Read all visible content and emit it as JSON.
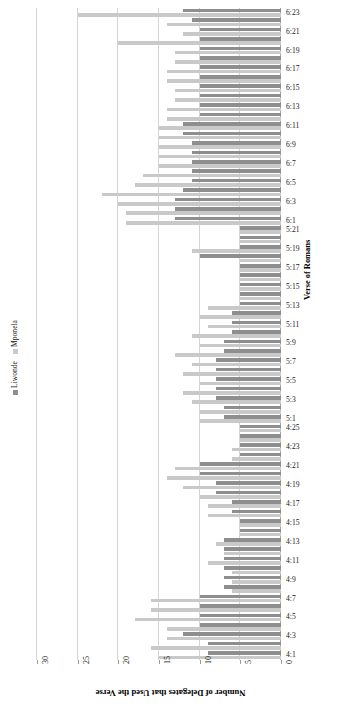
{
  "chart_data": {
    "type": "bar",
    "orientation": "horizontal",
    "title": "",
    "xlabel": "Number of Delegates that Used the Verse",
    "ylabel": "Verse of Romans",
    "xlim": [
      30,
      0
    ],
    "xticks": [
      30,
      25,
      20,
      15,
      10,
      5,
      0
    ],
    "xaxis_reversed": true,
    "grid": true,
    "legend_position": "left",
    "colors": {
      "Liwonde": "#8e8e8e",
      "Mponela": "#c9c9c9"
    },
    "categories": [
      "6:23",
      "6:22",
      "6:21",
      "6:20",
      "6:19",
      "6:18",
      "6:17",
      "6:16",
      "6:15",
      "6:14",
      "6:13",
      "6:12",
      "6:11",
      "6:10",
      "6:9",
      "6:8",
      "6:7",
      "6:6",
      "6:5",
      "6:4",
      "6:3",
      "6:2",
      "6:1",
      "5:21",
      "5:20",
      "5:19",
      "5:18",
      "5:17",
      "5:16",
      "5:15",
      "5:14",
      "5:13",
      "5:12",
      "5:11",
      "5:10",
      "5:9",
      "5:8",
      "5:7",
      "5:6",
      "5:5",
      "5:4",
      "5:3",
      "5:2",
      "5:1",
      "4:25",
      "4:24",
      "4:23",
      "4:22",
      "4:21",
      "4:20",
      "4:19",
      "4:18",
      "4:17",
      "4:16",
      "4:15",
      "4:14",
      "4:13",
      "4:12",
      "4:11",
      "4:10",
      "4:9",
      "4:8",
      "4:7",
      "4:6",
      "4:5",
      "4:4",
      "4:3",
      "4:2",
      "4:1"
    ],
    "series": [
      {
        "name": "Liwonde",
        "values": [
          12,
          11,
          10,
          10,
          10,
          10,
          10,
          10,
          10,
          10,
          10,
          10,
          12,
          12,
          11,
          11,
          11,
          11,
          11,
          12,
          13,
          13,
          13,
          5,
          5,
          5,
          10,
          5,
          5,
          5,
          5,
          5,
          6,
          6,
          6,
          7,
          7,
          8,
          8,
          8,
          8,
          8,
          7,
          7,
          5,
          5,
          5,
          5,
          10,
          10,
          8,
          8,
          6,
          6,
          5,
          5,
          7,
          7,
          7,
          7,
          7,
          7,
          10,
          10,
          10,
          10,
          12,
          9,
          9
        ]
      },
      {
        "name": "Mponela",
        "values": [
          25,
          14,
          12,
          20,
          13,
          13,
          14,
          14,
          13,
          13,
          14,
          14,
          15,
          15,
          15,
          15,
          15,
          17,
          18,
          22,
          20,
          19,
          19,
          5,
          5,
          11,
          5,
          5,
          5,
          5,
          5,
          9,
          10,
          9,
          11,
          10,
          13,
          11,
          12,
          10,
          12,
          11,
          10,
          10,
          5,
          5,
          6,
          6,
          13,
          14,
          12,
          10,
          9,
          9,
          5,
          5,
          8,
          7,
          9,
          6,
          6,
          6,
          16,
          16,
          18,
          14,
          14,
          16,
          15
        ]
      }
    ]
  },
  "legend": {
    "items": [
      {
        "label": "Liwonde",
        "color": "#8e8e8e"
      },
      {
        "label": "Mponela",
        "color": "#c9c9c9"
      }
    ]
  },
  "axes": {
    "x_title": "Number of Delegates that Used the Verse",
    "y_title": "Verse of Romans"
  }
}
